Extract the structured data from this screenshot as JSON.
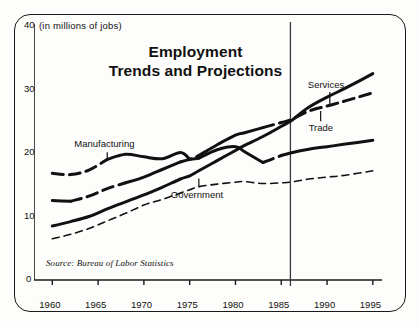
{
  "figure": {
    "title_line1": "Employment",
    "title_line2": "Trends and Projections",
    "axis_note": "(in millions of jobs)",
    "source": "Source: Bureau of Labor Statistics"
  },
  "labels": {
    "manufacturing": "Manufacturing",
    "government": "Government",
    "services": "Services",
    "trade": "Trade"
  },
  "chart_data": {
    "type": "line",
    "title": "Employment Trends and Projections",
    "subtitle": "",
    "xlabel": "",
    "ylabel": "(in millions of jobs)",
    "xlim": [
      1958,
      1996
    ],
    "ylim": [
      0,
      40
    ],
    "yticks": [
      0,
      10,
      20,
      30,
      40
    ],
    "xticks": [
      1960,
      1965,
      1970,
      1975,
      1980,
      1985,
      1990,
      1995
    ],
    "grid": false,
    "legend": "inline-annotations",
    "projection_divider_year": 1986,
    "annotations": [
      {
        "text": "Manufacturing",
        "year": 1966,
        "value": 20.0
      },
      {
        "text": "Government",
        "year": 1976,
        "value": 15.2
      },
      {
        "text": "Services",
        "year": 1990,
        "value": 28.5
      },
      {
        "text": "Trade",
        "year": 1989,
        "value": 25.5
      },
      {
        "text": "Source: Bureau of Labor Statistics",
        "year": 1962,
        "value": 2.5
      }
    ],
    "x": [
      1960,
      1962,
      1964,
      1966,
      1968,
      1970,
      1972,
      1974,
      1975,
      1976,
      1978,
      1980,
      1981,
      1983,
      1985,
      1986,
      1988,
      1990,
      1992,
      1995
    ],
    "series": [
      {
        "name": "Manufacturing",
        "style": "thick-dashed",
        "values": [
          16.8,
          16.6,
          17.3,
          19.0,
          19.8,
          19.4,
          19.1,
          20.1,
          19.0,
          19.2,
          20.5,
          21.0,
          20.2,
          18.5,
          19.6,
          20.0,
          20.6,
          21.0,
          21.4,
          22.0
        ]
      },
      {
        "name": "Trade",
        "style": "thick-dashed",
        "values": [
          12.5,
          12.4,
          13.2,
          14.4,
          15.3,
          16.2,
          17.4,
          18.6,
          19.0,
          19.6,
          21.3,
          22.8,
          23.2,
          24.0,
          24.8,
          25.2,
          26.6,
          27.4,
          28.2,
          29.5
        ]
      },
      {
        "name": "Services",
        "style": "thick-solid",
        "values": [
          8.5,
          9.2,
          10.0,
          11.2,
          12.3,
          13.4,
          14.6,
          15.9,
          16.4,
          17.2,
          18.8,
          20.4,
          21.2,
          22.6,
          24.2,
          25.0,
          27.2,
          28.8,
          30.2,
          32.5
        ]
      },
      {
        "name": "Government",
        "style": "thin-dashed",
        "values": [
          6.5,
          7.2,
          8.1,
          9.3,
          10.5,
          11.8,
          12.7,
          13.7,
          14.2,
          14.7,
          15.1,
          15.4,
          15.5,
          15.2,
          15.3,
          15.4,
          15.9,
          16.2,
          16.5,
          17.2
        ]
      }
    ]
  }
}
